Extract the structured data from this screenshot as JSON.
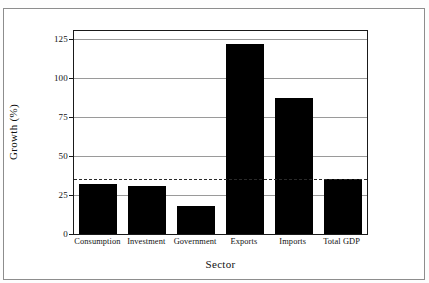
{
  "figure": {
    "ylabel": "Growth (%)",
    "xlabel": "Sector"
  },
  "chart_data": {
    "type": "bar",
    "title": "",
    "subtitle": "",
    "xlabel": "Sector",
    "ylabel": "Growth (%)",
    "categories": [
      "Consumption",
      "Investment",
      "Government",
      "Exports",
      "Imports",
      "Total GDP"
    ],
    "values": [
      32,
      31,
      18,
      122,
      87,
      35
    ],
    "series": [
      {
        "name": "Growth",
        "values": [
          32,
          31,
          18,
          122,
          87,
          35
        ],
        "color": "#000000"
      }
    ],
    "ylim": [
      0,
      130
    ],
    "yticks": [
      0,
      25,
      50,
      75,
      100,
      125
    ],
    "ytick_labels": [
      "0",
      "25",
      "50",
      "75",
      "100",
      "125"
    ],
    "grid": true,
    "grid_axis": "y",
    "legend": false,
    "legend_position": "none",
    "annotations": [
      {
        "type": "hline",
        "label": "",
        "value": 35,
        "style": "dashed",
        "color": "#2a2a2a"
      }
    ],
    "bar_color": "#000000",
    "background": "#ffffff"
  }
}
